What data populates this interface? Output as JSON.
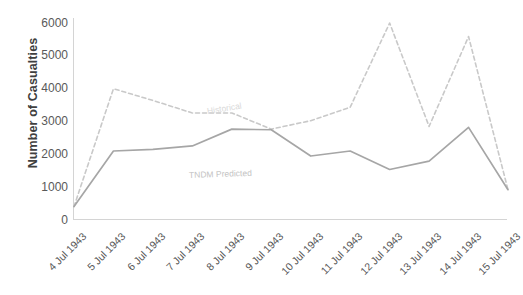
{
  "chart_data": {
    "type": "line",
    "title": "",
    "xlabel": "",
    "ylabel": "Number of Casualties",
    "ylim": [
      0,
      6000
    ],
    "yticks": [
      0,
      1000,
      2000,
      3000,
      4000,
      5000,
      6000
    ],
    "ytick_labels": [
      "0",
      "1000",
      "2000",
      "3000",
      "4000",
      "5000",
      "6000"
    ],
    "grid": false,
    "legend": "inline-series-labels",
    "categories": [
      "4 Jul 1943",
      "5 Jul 1943",
      "6 Jul 1943",
      "7 Jul 1943",
      "8 Jul 1943",
      "9 Jul 1943",
      "10 Jul 1943",
      "11 Jul 1943",
      "12 Jul 1943",
      "13 Jul 1943",
      "14 Jul 1943",
      "15 Jul 1943"
    ],
    "series": [
      {
        "name": "Historical",
        "style": "dashed",
        "color": "#c9c9c9",
        "values": [
          400,
          3900,
          3550,
          3180,
          3180,
          2700,
          2950,
          3350,
          5850,
          2780,
          5450,
          900
        ]
      },
      {
        "name": "TNDM Predicted",
        "style": "solid",
        "color": "#a6a6a6",
        "values": [
          400,
          2050,
          2100,
          2200,
          2700,
          2680,
          1900,
          2050,
          1500,
          1750,
          2750,
          900
        ]
      }
    ]
  },
  "axis": {
    "y_title": "Number of Casualties",
    "y_tick_0": "0",
    "y_tick_1": "1000",
    "y_tick_2": "2000",
    "y_tick_3": "3000",
    "y_tick_4": "4000",
    "y_tick_5": "5000",
    "y_tick_6": "6000"
  },
  "labels": {
    "historical": "Historical",
    "tndm": "TNDM Predicted"
  },
  "colors": {
    "historical_line": "#c9c9c9",
    "tndm_line": "#a6a6a6",
    "axis": "#d4d4d4",
    "tick_text": "#595959",
    "axis_title": "#3f3f3f"
  }
}
